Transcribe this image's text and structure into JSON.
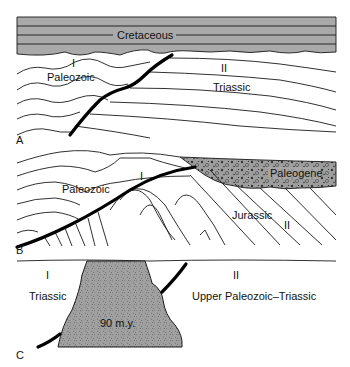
{
  "panels": [
    {
      "id": "A",
      "letter": "A",
      "labels": {
        "cover": "Cretaceous",
        "block1_roman": "I",
        "block1_unit": "Paleozoic",
        "block2_roman": "II",
        "block2_unit": "Triassic"
      }
    },
    {
      "id": "B",
      "letter": "B",
      "labels": {
        "cover": "Paleogene",
        "block1_roman": "I",
        "block1_unit": "Paleozoic",
        "block2_roman": "II",
        "block2_unit": "Jurassic"
      }
    },
    {
      "id": "C",
      "letter": "C",
      "labels": {
        "block1_roman": "I",
        "block1_unit": "Triassic",
        "block2_roman": "II",
        "block2_unit": "Upper Paleozoic–Triassic",
        "pluton_age": "90 m.y."
      }
    }
  ],
  "colors": {
    "cover_fill": "#a9a9a9",
    "pluton_fill": "#9a9a9a",
    "line": "#1a1a1a",
    "fault": "#000000"
  }
}
